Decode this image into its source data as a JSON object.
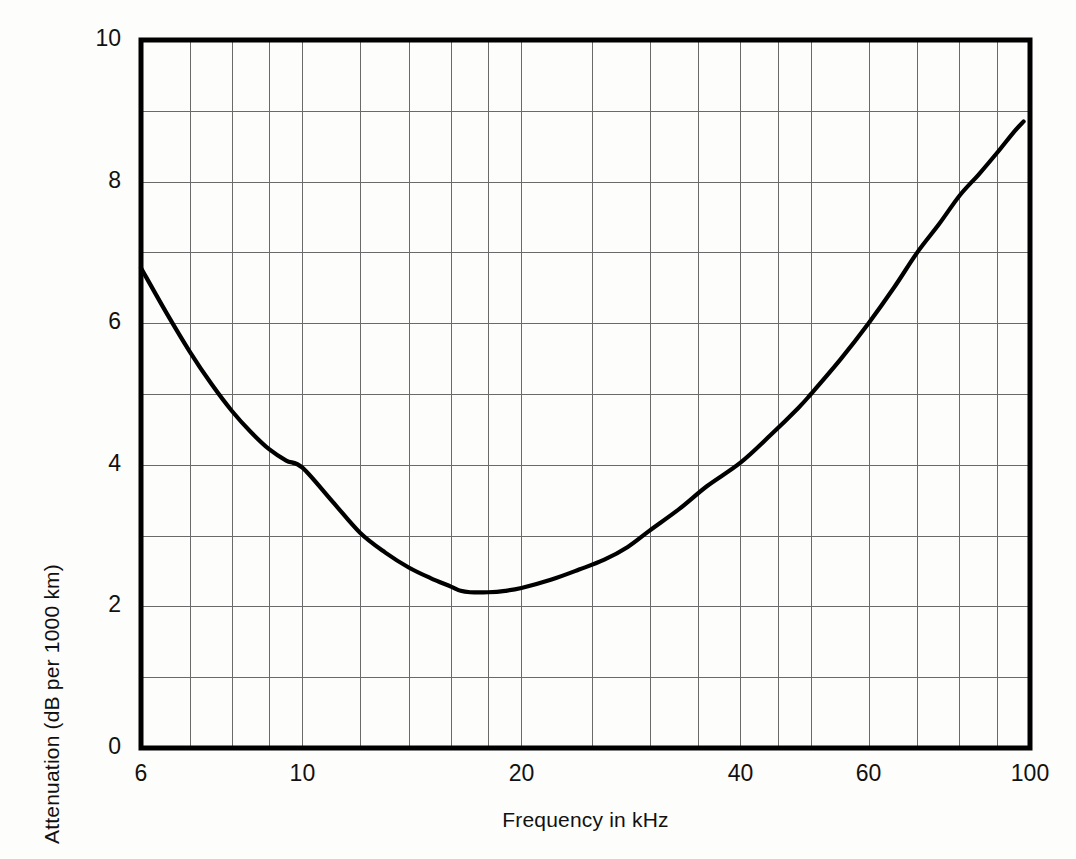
{
  "chart_data": {
    "type": "line",
    "title": "",
    "xlabel": "Frequency in kHz",
    "ylabel": "Attenuation  (dB per 1000 km)",
    "x_scale": "log",
    "y_scale": "linear",
    "xlim": [
      6,
      100
    ],
    "ylim": [
      0,
      10
    ],
    "grid": true,
    "legend": null,
    "x_tick_labels": [
      "6",
      "10",
      "20",
      "40",
      "60",
      "100"
    ],
    "x_tick_values": [
      6,
      10,
      20,
      40,
      60,
      100
    ],
    "x_gridline_values": [
      6,
      7,
      8,
      9,
      10,
      12,
      14,
      16,
      18,
      20,
      25,
      30,
      35,
      40,
      45,
      50,
      60,
      70,
      80,
      90,
      100
    ],
    "y_tick_labels": [
      "0",
      "2",
      "4",
      "6",
      "8",
      "10"
    ],
    "y_tick_values": [
      0,
      2,
      4,
      6,
      8,
      10
    ],
    "y_gridline_values": [
      0,
      1,
      2,
      3,
      4,
      5,
      6,
      7,
      8,
      9,
      10
    ],
    "series": [
      {
        "name": "Attenuation",
        "color": "#000000",
        "x": [
          6.0,
          6.5,
          7.0,
          7.5,
          8.0,
          8.5,
          9.0,
          9.5,
          10.0,
          11.0,
          12.0,
          13.0,
          14.0,
          15.0,
          16.0,
          16.5,
          17.0,
          18.0,
          19.0,
          20.0,
          22.0,
          24.0,
          26.0,
          28.0,
          30.0,
          33.0,
          36.0,
          40.0,
          44.0,
          48.0,
          50.0,
          55.0,
          60.0,
          65.0,
          70.0,
          75.0,
          80.0,
          85.0,
          90.0,
          95.0,
          98.0
        ],
        "y": [
          6.78,
          6.15,
          5.6,
          5.14,
          4.76,
          4.46,
          4.22,
          4.06,
          3.96,
          3.48,
          3.04,
          2.76,
          2.55,
          2.4,
          2.28,
          2.22,
          2.2,
          2.2,
          2.22,
          2.26,
          2.38,
          2.52,
          2.66,
          2.84,
          3.07,
          3.38,
          3.7,
          4.03,
          4.42,
          4.8,
          5.0,
          5.5,
          6.0,
          6.5,
          7.0,
          7.4,
          7.8,
          8.1,
          8.4,
          8.7,
          8.85
        ]
      }
    ],
    "colors": {
      "curve": "#000000",
      "axis": "#000000",
      "grid": "#6a6a6a",
      "background": "#fdfdfb"
    },
    "annotations": []
  },
  "axes": {
    "x_title": "Frequency in kHz",
    "y_title": "Attenuation  (dB per 1000 km)"
  }
}
